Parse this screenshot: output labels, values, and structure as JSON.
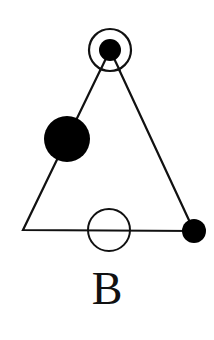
{
  "figure": {
    "label": "B",
    "colors": {
      "stroke": "#111111",
      "fill": "#000000",
      "background": "#ffffff"
    },
    "triangle": {
      "vertices": [
        {
          "name": "top",
          "x": 110,
          "y": 50
        },
        {
          "name": "bottom-left",
          "x": 23,
          "y": 230
        },
        {
          "name": "bottom-right",
          "x": 194,
          "y": 231
        }
      ]
    },
    "markers": [
      {
        "name": "top-inner-dot",
        "type": "filled",
        "cx": 110,
        "cy": 50,
        "r": 11
      },
      {
        "name": "top-outer-ring",
        "type": "open",
        "cx": 110,
        "cy": 50,
        "r": 21
      },
      {
        "name": "left-side-large-dot",
        "type": "filled",
        "cx": 67,
        "cy": 139,
        "r": 23
      },
      {
        "name": "bottom-center-ring",
        "type": "open",
        "cx": 109,
        "cy": 230,
        "r": 21
      },
      {
        "name": "bottom-right-dot",
        "type": "filled",
        "cx": 194,
        "cy": 231,
        "r": 12
      }
    ]
  }
}
